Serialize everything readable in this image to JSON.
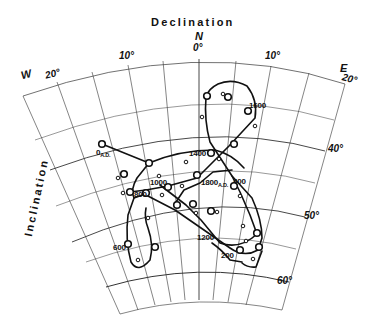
{
  "figure": {
    "title": "Declination",
    "y_axis_label": "Inclination",
    "colors": {
      "grid": "#333333",
      "curve": "#111111",
      "background": "#ffffff"
    }
  },
  "axes": {
    "declination": {
      "north_label": "N",
      "west_label": "W",
      "east_label": "E",
      "ticks": [
        {
          "value": -20,
          "label": "20°"
        },
        {
          "value": -10,
          "label": "10°"
        },
        {
          "value": 0,
          "label": "0°"
        },
        {
          "value": 10,
          "label": "10°"
        },
        {
          "value": 20,
          "label": "20°"
        }
      ]
    },
    "inclination": {
      "ticks": [
        {
          "value": 40,
          "label": "40°"
        },
        {
          "value": 50,
          "label": "50°"
        },
        {
          "value": 60,
          "label": "60°"
        }
      ]
    }
  },
  "age_labels": {
    "a0": "0",
    "a0_sub": "A.D.",
    "a200": "200",
    "a400": "400",
    "a600": "600",
    "a800": "800",
    "a1000": "1000",
    "a1200": "1200",
    "a1400": "1400",
    "a1600": "1600",
    "a1800": "1800",
    "a1800_sub": "A.D."
  }
}
